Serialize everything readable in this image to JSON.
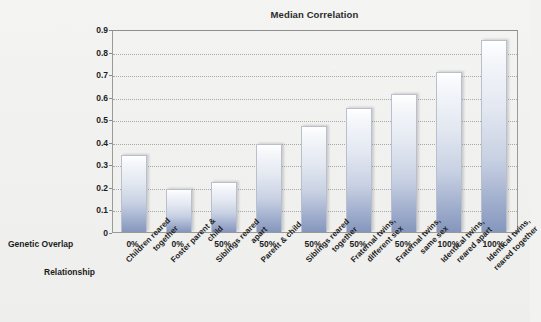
{
  "chart_data": {
    "type": "bar",
    "title": "Median Correlation",
    "xlabel": "",
    "ylabel": "",
    "ylim": [
      0,
      0.9
    ],
    "ytick_labels": [
      "0",
      "0.1",
      "0.2",
      "0.3",
      "0.4",
      "0.5",
      "0.6",
      "0.7",
      "0.8",
      "0.9"
    ],
    "ytick_values": [
      0,
      0.1,
      0.2,
      0.3,
      0.4,
      0.5,
      0.6,
      0.7,
      0.8,
      0.9
    ],
    "grid": true,
    "legend": "none",
    "categories": [
      "Children reared together",
      "Foster parent & child",
      "Siblings reared apart",
      "Parent & child",
      "Siblings reared together",
      "Fraternal twins, different sex",
      "Fraternal twins, same sex",
      "Identical twins, reared apart",
      "Identical twins, reared together"
    ],
    "values": [
      0.34,
      0.19,
      0.22,
      0.39,
      0.47,
      0.55,
      0.61,
      0.71,
      0.85
    ],
    "secondary_categories": [
      "0%",
      "0%",
      "50%",
      "50%",
      "50%",
      "50%",
      "50%",
      "100%",
      "100%"
    ],
    "row_label_overlap": "Genetic Overlap",
    "row_label_relationship": "Relationship",
    "bar_color": "#aab8d4",
    "axis_color": "#9a9a9a",
    "grid_color": "#a8a8a8"
  },
  "axis_rows": {
    "overlap_label": "Genetic Overlap",
    "relationship_label": "Relationship"
  },
  "relationship_lines": [
    [
      "Children reared",
      "together"
    ],
    [
      "Foster parent &",
      "child"
    ],
    [
      "Siblings reared",
      "apart"
    ],
    [
      "Parent & child"
    ],
    [
      "Siblings reared",
      "together"
    ],
    [
      "Fraternal twins,",
      "different sex"
    ],
    [
      "Fraternal twins,",
      "same sex"
    ],
    [
      "Identical twins,",
      "reared apart"
    ],
    [
      "Identical twins,",
      "reared together"
    ]
  ]
}
